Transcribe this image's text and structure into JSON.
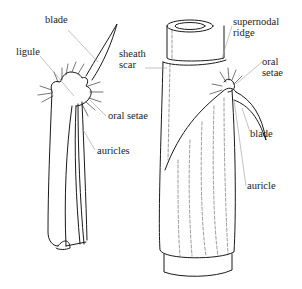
{
  "figure": {
    "left_drawing": {
      "name": "detached leaf sheath",
      "labels": [
        {
          "id": "blade",
          "text": "blade",
          "x": 45,
          "y": 20
        },
        {
          "id": "ligule",
          "text": "ligule",
          "x": 16,
          "y": 49
        },
        {
          "id": "oral-setae",
          "text": "oral setae",
          "x": 108,
          "y": 112
        },
        {
          "id": "auricles",
          "text": "auricles",
          "x": 97,
          "y": 146
        }
      ]
    },
    "right_drawing": {
      "name": "culm node with sheath",
      "labels": [
        {
          "id": "sheath-scar",
          "text": "sheath\nscar",
          "x": 119,
          "y": 49
        },
        {
          "id": "supernodal-ridge",
          "text": "supernodal\nridge",
          "x": 233,
          "y": 18
        },
        {
          "id": "oral-setae-right",
          "text": "oral\nsetae",
          "x": 262,
          "y": 57
        },
        {
          "id": "blade-right",
          "text": "blade",
          "x": 250,
          "y": 128
        },
        {
          "id": "auricle",
          "text": "auricle",
          "x": 247,
          "y": 181
        }
      ]
    },
    "colors": {
      "line": "#1a1a1a",
      "leader": "#9a9a9a",
      "stipple": "#777777"
    }
  }
}
